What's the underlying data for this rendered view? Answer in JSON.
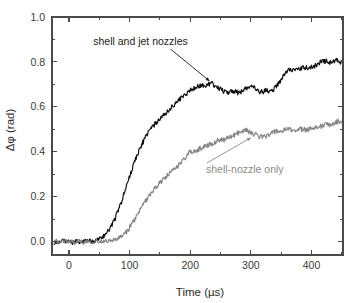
{
  "chart_data": {
    "type": "line",
    "title": "",
    "xlabel": "Time (µs)",
    "ylabel": "Δφ (rad)",
    "xlim": [
      -28,
      452
    ],
    "ylim": [
      -0.06,
      1.0
    ],
    "xticks": [
      0,
      100,
      200,
      300,
      400
    ],
    "xticklabels": [
      "0",
      "100",
      "200",
      "300",
      "400"
    ],
    "yticks": [
      0.0,
      0.2,
      0.4,
      0.6,
      0.8,
      1.0
    ],
    "yticklabels": [
      "0.0",
      "0.2",
      "0.4",
      "0.6",
      "0.8",
      "1.0"
    ],
    "xminorticks": [
      -50,
      50,
      150,
      250,
      350,
      450
    ],
    "yminorticks": [
      0.1,
      0.3,
      0.5,
      0.7,
      0.9
    ],
    "grid": false,
    "legend": "annotations",
    "frame": "box",
    "colors": {
      "shell_and_jet": "#0d0d0d",
      "shell_only": "#858585",
      "axis": "#4a4a4a",
      "background": "#ffffff"
    },
    "annotations": [
      {
        "text": "shell and jet nozzles",
        "color": "#1a1a1a",
        "text_xy": [
          118,
          0.875
        ],
        "point_xy": [
          232,
          0.715
        ]
      },
      {
        "text": "shell-nozzle only",
        "color": "#858585",
        "text_xy": [
          290,
          0.305
        ],
        "point_xy": [
          300,
          0.462
        ]
      }
    ],
    "series": [
      {
        "name": "shell and jet nozzles",
        "color": "#0d0d0d",
        "x": [
          -25,
          -20,
          -15,
          -10,
          -5,
          0,
          5,
          10,
          15,
          20,
          25,
          30,
          35,
          40,
          45,
          50,
          55,
          60,
          65,
          70,
          75,
          80,
          85,
          90,
          95,
          100,
          105,
          110,
          115,
          120,
          125,
          130,
          135,
          140,
          145,
          150,
          155,
          160,
          165,
          170,
          175,
          180,
          185,
          190,
          195,
          200,
          205,
          210,
          215,
          220,
          225,
          230,
          235,
          240,
          245,
          250,
          255,
          260,
          265,
          270,
          275,
          280,
          285,
          290,
          295,
          300,
          305,
          310,
          315,
          320,
          325,
          330,
          335,
          340,
          345,
          350,
          355,
          360,
          365,
          370,
          375,
          380,
          385,
          390,
          395,
          400,
          405,
          410,
          415,
          420,
          425,
          430,
          435,
          440,
          445,
          450
        ],
        "y": [
          -0.005,
          0.0,
          -0.008,
          0.004,
          -0.003,
          0.002,
          -0.006,
          0.003,
          0.0,
          -0.004,
          0.005,
          0.0,
          0.004,
          -0.002,
          0.008,
          0.012,
          0.02,
          0.032,
          0.048,
          0.07,
          0.098,
          0.128,
          0.165,
          0.205,
          0.248,
          0.29,
          0.33,
          0.368,
          0.402,
          0.432,
          0.458,
          0.482,
          0.502,
          0.518,
          0.532,
          0.545,
          0.558,
          0.572,
          0.586,
          0.6,
          0.614,
          0.628,
          0.64,
          0.652,
          0.662,
          0.672,
          0.682,
          0.69,
          0.694,
          0.696,
          0.69,
          0.7,
          0.705,
          0.695,
          0.688,
          0.678,
          0.67,
          0.664,
          0.668,
          0.672,
          0.666,
          0.662,
          0.668,
          0.678,
          0.688,
          0.692,
          0.684,
          0.672,
          0.665,
          0.668,
          0.672,
          0.668,
          0.672,
          0.684,
          0.7,
          0.718,
          0.742,
          0.762,
          0.77,
          0.765,
          0.762,
          0.768,
          0.772,
          0.776,
          0.772,
          0.775,
          0.782,
          0.79,
          0.798,
          0.806,
          0.802,
          0.796,
          0.8,
          0.806,
          0.802,
          0.798
        ]
      },
      {
        "name": "shell-nozzle only",
        "color": "#858585",
        "x": [
          -25,
          -20,
          -15,
          -10,
          -5,
          0,
          5,
          10,
          15,
          20,
          25,
          30,
          35,
          40,
          45,
          50,
          55,
          60,
          65,
          70,
          75,
          80,
          85,
          90,
          95,
          100,
          105,
          110,
          115,
          120,
          125,
          130,
          135,
          140,
          145,
          150,
          155,
          160,
          165,
          170,
          175,
          180,
          185,
          190,
          195,
          200,
          205,
          210,
          215,
          220,
          225,
          230,
          235,
          240,
          245,
          250,
          255,
          260,
          265,
          270,
          275,
          280,
          285,
          290,
          295,
          300,
          305,
          310,
          315,
          320,
          325,
          330,
          335,
          340,
          345,
          350,
          355,
          360,
          365,
          370,
          375,
          380,
          385,
          390,
          395,
          400,
          405,
          410,
          415,
          420,
          425,
          430,
          435,
          440,
          445,
          450
        ],
        "y": [
          -0.004,
          0.003,
          -0.006,
          0.0,
          0.004,
          -0.003,
          0.002,
          -0.005,
          0.003,
          0.0,
          -0.004,
          0.002,
          0.0,
          -0.003,
          0.002,
          0.0,
          0.002,
          0.004,
          0.004,
          0.006,
          0.008,
          0.012,
          0.02,
          0.03,
          0.044,
          0.062,
          0.082,
          0.105,
          0.128,
          0.152,
          0.175,
          0.196,
          0.215,
          0.232,
          0.248,
          0.262,
          0.275,
          0.288,
          0.3,
          0.312,
          0.325,
          0.338,
          0.352,
          0.368,
          0.385,
          0.4,
          0.398,
          0.404,
          0.412,
          0.42,
          0.425,
          0.43,
          0.436,
          0.442,
          0.45,
          0.456,
          0.452,
          0.458,
          0.465,
          0.47,
          0.478,
          0.486,
          0.492,
          0.498,
          0.492,
          0.486,
          0.478,
          0.472,
          0.468,
          0.465,
          0.47,
          0.478,
          0.485,
          0.488,
          0.492,
          0.49,
          0.495,
          0.5,
          0.498,
          0.494,
          0.498,
          0.502,
          0.5,
          0.496,
          0.5,
          0.506,
          0.512,
          0.508,
          0.512,
          0.518,
          0.522,
          0.518,
          0.524,
          0.53,
          0.538,
          0.535
        ]
      }
    ],
    "noise": {
      "shell_and_jet_amplitude": 0.011,
      "shell_only_amplitude": 0.011,
      "baseline_amplitude": 0.009
    }
  }
}
